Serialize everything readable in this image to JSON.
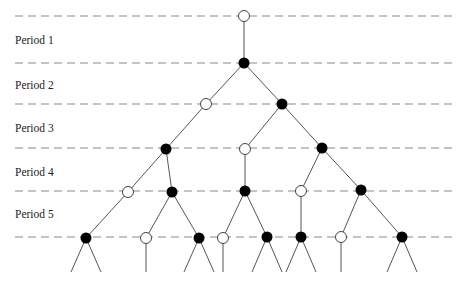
{
  "diagram": {
    "type": "game-tree",
    "colors": {
      "dash": "#8a8a8a",
      "edge": "#555555",
      "filled_node": "#000000",
      "open_node_stroke": "#444444",
      "open_node_fill": "#ffffff"
    },
    "period_lines_y": [
      16,
      63,
      104,
      148,
      191,
      237
    ],
    "dash_x_range": [
      15,
      457
    ],
    "periods": [
      {
        "label": "Period 1",
        "y": 34
      },
      {
        "label": "Period 2",
        "y": 79
      },
      {
        "label": "Period 3",
        "y": 122
      },
      {
        "label": "Period 4",
        "y": 166
      },
      {
        "label": "Period 5",
        "y": 208
      }
    ],
    "nodes": [
      {
        "id": "n0",
        "x": 244,
        "y": 16,
        "type": "open"
      },
      {
        "id": "n1",
        "x": 244,
        "y": 63,
        "type": "filled"
      },
      {
        "id": "n2a",
        "x": 206,
        "y": 104,
        "type": "open"
      },
      {
        "id": "n2b",
        "x": 282,
        "y": 104,
        "type": "filled"
      },
      {
        "id": "n3a",
        "x": 166,
        "y": 149,
        "type": "filled"
      },
      {
        "id": "n3b",
        "x": 245,
        "y": 149,
        "type": "open"
      },
      {
        "id": "n3c",
        "x": 322,
        "y": 148,
        "type": "filled"
      },
      {
        "id": "n4a",
        "x": 128,
        "y": 192,
        "type": "open"
      },
      {
        "id": "n4b",
        "x": 172,
        "y": 192,
        "type": "filled"
      },
      {
        "id": "n4c",
        "x": 245,
        "y": 191,
        "type": "filled"
      },
      {
        "id": "n4d",
        "x": 301,
        "y": 191,
        "type": "open"
      },
      {
        "id": "n4e",
        "x": 361,
        "y": 190,
        "type": "filled"
      },
      {
        "id": "n5a",
        "x": 86,
        "y": 238,
        "type": "filled"
      },
      {
        "id": "n5b",
        "x": 146,
        "y": 238,
        "type": "open"
      },
      {
        "id": "n5c",
        "x": 199,
        "y": 238,
        "type": "filled"
      },
      {
        "id": "n5d",
        "x": 223,
        "y": 238,
        "type": "open"
      },
      {
        "id": "n5e",
        "x": 267,
        "y": 237,
        "type": "filled"
      },
      {
        "id": "n5f",
        "x": 301,
        "y": 237,
        "type": "filled"
      },
      {
        "id": "n5g",
        "x": 341,
        "y": 237,
        "type": "open"
      },
      {
        "id": "n5h",
        "x": 402,
        "y": 237,
        "type": "filled"
      }
    ],
    "edges": [
      [
        "n0",
        "n1"
      ],
      [
        "n1",
        "n2a"
      ],
      [
        "n1",
        "n2b"
      ],
      [
        "n2a",
        "n3a"
      ],
      [
        "n2b",
        "n3b"
      ],
      [
        "n2b",
        "n3c"
      ],
      [
        "n3a",
        "n4a"
      ],
      [
        "n3a",
        "n4b"
      ],
      [
        "n3b",
        "n4c"
      ],
      [
        "n3c",
        "n4d"
      ],
      [
        "n3c",
        "n4e"
      ],
      [
        "n4a",
        "n5a"
      ],
      [
        "n4b",
        "n5b"
      ],
      [
        "n4b",
        "n5c"
      ],
      [
        "n4c",
        "n5d"
      ],
      [
        "n4c",
        "n5e"
      ],
      [
        "n4d",
        "n5f"
      ],
      [
        "n4e",
        "n5g"
      ],
      [
        "n4e",
        "n5h"
      ]
    ],
    "stub_bottom_y": 272,
    "stub_spread": 15,
    "node_radius": 5.5
  }
}
